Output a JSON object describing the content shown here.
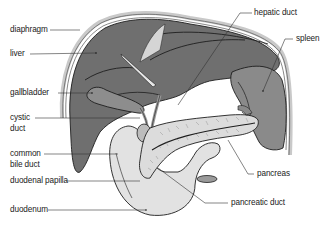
{
  "diagram": {
    "type": "anatomical illustration",
    "colors": {
      "background": "#ffffff",
      "organ_dark": "#6e6e6e",
      "organ_mid": "#8a8a8a",
      "organ_light": "#d8d8d8",
      "outline": "#1e1e1e",
      "diaphragm": "#bdbdbd",
      "leader_line": "#333333",
      "text": "#222222"
    },
    "labels": {
      "diaphragm": "diaphragm",
      "liver": "liver",
      "gallbladder": "gallbladder",
      "cystic_duct_line1": "cystic",
      "cystic_duct_line2": "duct",
      "common_bile_duct_line1": "common",
      "common_bile_duct_line2": "bile duct",
      "duodenal_papilla": "duodenal papilla",
      "duodenum": "duodenum",
      "hepatic_duct": "hepatic duct",
      "spleen": "spleen",
      "pancreas": "pancreas",
      "pancreatic_duct": "pancreatic duct"
    }
  }
}
